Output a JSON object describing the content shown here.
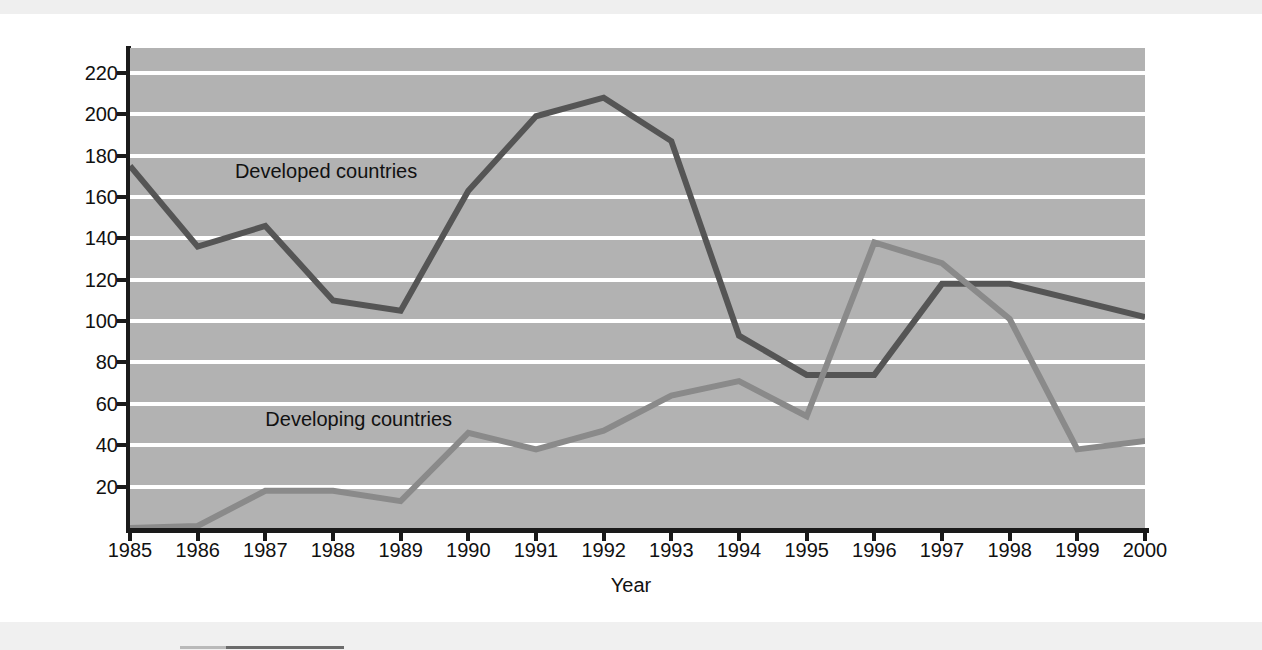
{
  "chart_data": {
    "type": "line",
    "title": "",
    "xlabel": "Year",
    "ylabel": "Number of Claims Filed",
    "x": [
      1985,
      1986,
      1987,
      1988,
      1989,
      1990,
      1991,
      1992,
      1993,
      1994,
      1995,
      1996,
      1997,
      1998,
      1999,
      2000
    ],
    "categories": [
      "1985",
      "1986",
      "1987",
      "1988",
      "1989",
      "1990",
      "1991",
      "1992",
      "1993",
      "1994",
      "1995",
      "1996",
      "1997",
      "1998",
      "1999",
      "2000"
    ],
    "xlim": [
      1985,
      2000
    ],
    "ylim": [
      0,
      232
    ],
    "yticks": [
      20,
      40,
      60,
      80,
      100,
      120,
      140,
      160,
      180,
      200,
      220
    ],
    "ytick_labels": [
      "20",
      "40",
      "60",
      "80",
      "100",
      "120",
      "140",
      "160",
      "180",
      "200",
      "220"
    ],
    "grid": true,
    "gridline_color": "#ffffff",
    "plot_background": "#b2b2b2",
    "legend": "inline-annotations",
    "series": [
      {
        "name": "Developed countries",
        "color": "#555555",
        "label_x": 1986.55,
        "label_y": 172,
        "values": [
          175,
          136,
          146,
          110,
          105,
          163,
          199,
          208,
          187,
          93,
          74,
          74,
          118,
          118,
          110,
          102
        ]
      },
      {
        "name": "Developing countries",
        "color": "#8a8a8a",
        "label_x": 1987.0,
        "label_y": 52,
        "values": [
          0,
          1,
          18,
          18,
          13,
          46,
          38,
          47,
          64,
          71,
          54,
          138,
          128,
          101,
          38,
          42
        ]
      }
    ]
  }
}
